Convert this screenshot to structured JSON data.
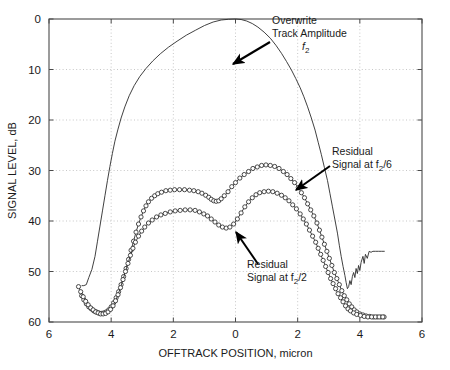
{
  "chart_data": {
    "type": "line",
    "title": "",
    "xlabel": "OFFTRACK POSITION, micron",
    "ylabel": "SIGNAL LEVEL, dB",
    "xlim": [
      -6,
      6
    ],
    "ylim": [
      60,
      0
    ],
    "y_inverted": true,
    "grid": true,
    "grid_style": "dotted",
    "legend_position": "none (inline annotations with arrows)",
    "xticks": [
      -6,
      -4,
      -2,
      0,
      2,
      4,
      6
    ],
    "xticklabels": [
      "6",
      "4",
      "2",
      "0",
      "2",
      "4",
      "6"
    ],
    "yticks": [
      0,
      10,
      20,
      30,
      40,
      50,
      60
    ],
    "yticklabels": [
      "0",
      "10",
      "20",
      "30",
      "40",
      "50",
      "60"
    ],
    "annotations": [
      {
        "name": "overwrite-track-amplitude",
        "line1": "Overwrite",
        "line2": "Track Amplitude",
        "line3_base": "f",
        "line3_sub": "2",
        "text_x": 272,
        "text_y": 24,
        "arrow_from": [
          270,
          42
        ],
        "arrow_to": [
          233,
          64
        ]
      },
      {
        "name": "residual-signal-f2-over-6",
        "line1": "Residual",
        "line2_base": "Signal at f",
        "line2_sub": "2",
        "line2_tail": "/6",
        "text_x": 332,
        "text_y": 155,
        "arrow_from": [
          330,
          166
        ],
        "arrow_to": [
          296,
          190
        ]
      },
      {
        "name": "residual-signal-f2-over-2",
        "line1": "Residual",
        "line2_base": "Signal at f",
        "line2_sub": "2",
        "line2_tail": "/2",
        "text_x": 247,
        "text_y": 268,
        "arrow_from": [
          258,
          264
        ],
        "arrow_to": [
          236,
          232
        ]
      }
    ],
    "series": [
      {
        "name": "Overwrite Track Amplitude f2",
        "style": "solid-thin-line",
        "marker": "none",
        "points": [
          [
            -4.95,
            52.8
          ],
          [
            -4.88,
            52.8
          ],
          [
            -4.8,
            52.6
          ],
          [
            -4.72,
            51.2
          ],
          [
            -4.62,
            49.6
          ],
          [
            -4.52,
            47.0
          ],
          [
            -4.44,
            44.0
          ],
          [
            -4.36,
            41.0
          ],
          [
            -4.28,
            38.0
          ],
          [
            -4.2,
            35.0
          ],
          [
            -4.12,
            32.0
          ],
          [
            -4.04,
            29.2
          ],
          [
            -3.96,
            26.6
          ],
          [
            -3.88,
            24.2
          ],
          [
            -3.78,
            21.8
          ],
          [
            -3.68,
            19.6
          ],
          [
            -3.56,
            17.4
          ],
          [
            -3.42,
            15.2
          ],
          [
            -3.26,
            13.2
          ],
          [
            -3.08,
            11.4
          ],
          [
            -2.88,
            9.8
          ],
          [
            -2.66,
            8.3
          ],
          [
            -2.42,
            6.9
          ],
          [
            -2.16,
            5.6
          ],
          [
            -1.88,
            4.4
          ],
          [
            -1.58,
            3.2
          ],
          [
            -1.28,
            2.2
          ],
          [
            -1.0,
            1.3
          ],
          [
            -0.72,
            0.6
          ],
          [
            -0.46,
            0.2
          ],
          [
            -0.22,
            0.05
          ],
          [
            0.0,
            0.0
          ],
          [
            0.18,
            0.1
          ],
          [
            0.36,
            0.4
          ],
          [
            0.54,
            0.9
          ],
          [
            0.72,
            1.6
          ],
          [
            0.92,
            2.6
          ],
          [
            1.12,
            3.8
          ],
          [
            1.3,
            5.2
          ],
          [
            1.48,
            6.8
          ],
          [
            1.64,
            8.4
          ],
          [
            1.8,
            10.1
          ],
          [
            1.94,
            11.8
          ],
          [
            2.08,
            13.6
          ],
          [
            2.2,
            15.4
          ],
          [
            2.32,
            17.4
          ],
          [
            2.44,
            19.6
          ],
          [
            2.56,
            22.0
          ],
          [
            2.66,
            24.4
          ],
          [
            2.76,
            26.8
          ],
          [
            2.86,
            29.4
          ],
          [
            2.96,
            32.0
          ],
          [
            3.04,
            34.6
          ],
          [
            3.12,
            37.2
          ],
          [
            3.2,
            39.8
          ],
          [
            3.28,
            42.4
          ],
          [
            3.34,
            44.8
          ],
          [
            3.4,
            47.0
          ],
          [
            3.46,
            49.0
          ],
          [
            3.52,
            50.8
          ],
          [
            3.56,
            52.2
          ],
          [
            3.6,
            53.4
          ],
          [
            3.64,
            53.0
          ],
          [
            3.68,
            51.8
          ],
          [
            3.72,
            52.6
          ],
          [
            3.76,
            51.0
          ],
          [
            3.8,
            50.2
          ],
          [
            3.84,
            51.2
          ],
          [
            3.88,
            49.4
          ],
          [
            3.92,
            50.4
          ],
          [
            3.96,
            48.8
          ],
          [
            4.0,
            49.8
          ],
          [
            4.04,
            48.2
          ],
          [
            4.1,
            47.0
          ],
          [
            4.14,
            48.4
          ],
          [
            4.18,
            46.6
          ],
          [
            4.24,
            47.4
          ],
          [
            4.3,
            46.0
          ],
          [
            4.36,
            46.2
          ],
          [
            4.42,
            46.0
          ],
          [
            4.5,
            46.0
          ],
          [
            4.6,
            46.0
          ],
          [
            4.7,
            46.0
          ],
          [
            4.8,
            46.0
          ]
        ]
      },
      {
        "name": "Residual Signal at f2/6",
        "style": "solid-thin-line-with-markers",
        "marker": "open-circle",
        "points": [
          [
            -4.95,
            54.8
          ],
          [
            -4.88,
            55.6
          ],
          [
            -4.8,
            56.4
          ],
          [
            -4.72,
            57.0
          ],
          [
            -4.64,
            57.4
          ],
          [
            -4.56,
            57.8
          ],
          [
            -4.48,
            58.0
          ],
          [
            -4.4,
            58.2
          ],
          [
            -4.32,
            58.3
          ],
          [
            -4.24,
            58.2
          ],
          [
            -4.16,
            58.0
          ],
          [
            -4.08,
            57.6
          ],
          [
            -4.0,
            57.0
          ],
          [
            -3.92,
            56.2
          ],
          [
            -3.84,
            55.2
          ],
          [
            -3.76,
            54.0
          ],
          [
            -3.68,
            52.6
          ],
          [
            -3.6,
            51.0
          ],
          [
            -3.52,
            49.4
          ],
          [
            -3.44,
            47.6
          ],
          [
            -3.36,
            45.8
          ],
          [
            -3.28,
            44.0
          ],
          [
            -3.2,
            42.2
          ],
          [
            -3.12,
            40.6
          ],
          [
            -3.04,
            39.2
          ],
          [
            -2.96,
            38.0
          ],
          [
            -2.88,
            37.0
          ],
          [
            -2.8,
            36.2
          ],
          [
            -2.7,
            35.5
          ],
          [
            -2.6,
            35.0
          ],
          [
            -2.5,
            34.6
          ],
          [
            -2.38,
            34.3
          ],
          [
            -2.24,
            34.0
          ],
          [
            -2.1,
            33.9
          ],
          [
            -1.96,
            33.8
          ],
          [
            -1.8,
            33.8
          ],
          [
            -1.64,
            33.8
          ],
          [
            -1.48,
            33.9
          ],
          [
            -1.34,
            34.0
          ],
          [
            -1.2,
            34.2
          ],
          [
            -1.08,
            34.5
          ],
          [
            -0.96,
            34.9
          ],
          [
            -0.86,
            35.3
          ],
          [
            -0.78,
            35.7
          ],
          [
            -0.7,
            36.0
          ],
          [
            -0.62,
            36.1
          ],
          [
            -0.54,
            36.0
          ],
          [
            -0.46,
            35.6
          ],
          [
            -0.36,
            35.0
          ],
          [
            -0.24,
            34.2
          ],
          [
            -0.12,
            33.2
          ],
          [
            0.0,
            32.4
          ],
          [
            0.14,
            31.5
          ],
          [
            0.28,
            30.8
          ],
          [
            0.42,
            30.2
          ],
          [
            0.56,
            29.6
          ],
          [
            0.7,
            29.3
          ],
          [
            0.84,
            29.0
          ],
          [
            0.98,
            28.9
          ],
          [
            1.12,
            29.0
          ],
          [
            1.26,
            29.2
          ],
          [
            1.4,
            29.6
          ],
          [
            1.54,
            30.2
          ],
          [
            1.66,
            30.8
          ],
          [
            1.78,
            31.6
          ],
          [
            1.9,
            32.4
          ],
          [
            2.02,
            33.4
          ],
          [
            2.12,
            34.4
          ],
          [
            2.22,
            35.4
          ],
          [
            2.32,
            36.6
          ],
          [
            2.42,
            37.8
          ],
          [
            2.52,
            39.0
          ],
          [
            2.62,
            40.4
          ],
          [
            2.7,
            41.8
          ],
          [
            2.78,
            43.2
          ],
          [
            2.86,
            44.6
          ],
          [
            2.94,
            46.0
          ],
          [
            3.02,
            47.4
          ],
          [
            3.1,
            48.8
          ],
          [
            3.18,
            50.2
          ],
          [
            3.26,
            51.4
          ],
          [
            3.34,
            52.6
          ],
          [
            3.42,
            53.8
          ],
          [
            3.5,
            54.8
          ],
          [
            3.58,
            55.6
          ],
          [
            3.66,
            56.4
          ],
          [
            3.74,
            57.0
          ],
          [
            3.82,
            57.6
          ],
          [
            3.9,
            58.0
          ],
          [
            4.0,
            58.4
          ],
          [
            4.1,
            58.6
          ],
          [
            4.2,
            58.8
          ],
          [
            4.32,
            58.9
          ],
          [
            4.44,
            59.0
          ],
          [
            4.56,
            59.0
          ],
          [
            4.68,
            59.0
          ],
          [
            4.78,
            59.0
          ]
        ]
      },
      {
        "name": "Residual Signal at f2/2",
        "style": "solid-thin-line-with-markers",
        "marker": "open-circle",
        "points": [
          [
            -5.05,
            53.0
          ],
          [
            -4.98,
            54.0
          ],
          [
            -4.9,
            55.0
          ],
          [
            -4.82,
            55.9
          ],
          [
            -4.74,
            56.6
          ],
          [
            -4.66,
            57.2
          ],
          [
            -4.58,
            57.6
          ],
          [
            -4.5,
            58.0
          ],
          [
            -4.42,
            58.2
          ],
          [
            -4.34,
            58.4
          ],
          [
            -4.26,
            58.4
          ],
          [
            -4.18,
            58.3
          ],
          [
            -4.1,
            58.0
          ],
          [
            -4.02,
            57.5
          ],
          [
            -3.94,
            56.8
          ],
          [
            -3.86,
            55.8
          ],
          [
            -3.78,
            54.6
          ],
          [
            -3.7,
            53.2
          ],
          [
            -3.62,
            51.6
          ],
          [
            -3.54,
            50.0
          ],
          [
            -3.46,
            48.4
          ],
          [
            -3.38,
            46.8
          ],
          [
            -3.3,
            45.4
          ],
          [
            -3.22,
            44.2
          ],
          [
            -3.12,
            43.0
          ],
          [
            -3.02,
            42.0
          ],
          [
            -2.92,
            41.2
          ],
          [
            -2.8,
            40.4
          ],
          [
            -2.68,
            39.8
          ],
          [
            -2.54,
            39.2
          ],
          [
            -2.4,
            38.8
          ],
          [
            -2.26,
            38.5
          ],
          [
            -2.1,
            38.2
          ],
          [
            -1.94,
            38.0
          ],
          [
            -1.78,
            37.9
          ],
          [
            -1.62,
            37.8
          ],
          [
            -1.46,
            37.8
          ],
          [
            -1.3,
            37.9
          ],
          [
            -1.16,
            38.2
          ],
          [
            -1.02,
            38.6
          ],
          [
            -0.9,
            39.0
          ],
          [
            -0.78,
            39.6
          ],
          [
            -0.66,
            40.2
          ],
          [
            -0.54,
            40.8
          ],
          [
            -0.42,
            41.2
          ],
          [
            -0.3,
            41.4
          ],
          [
            -0.18,
            41.2
          ],
          [
            -0.06,
            40.6
          ],
          [
            0.06,
            39.6
          ],
          [
            0.18,
            38.4
          ],
          [
            0.3,
            37.2
          ],
          [
            0.42,
            36.2
          ],
          [
            0.54,
            35.4
          ],
          [
            0.66,
            34.8
          ],
          [
            0.78,
            34.4
          ],
          [
            0.92,
            34.2
          ],
          [
            1.06,
            34.1
          ],
          [
            1.2,
            34.2
          ],
          [
            1.34,
            34.5
          ],
          [
            1.48,
            34.9
          ],
          [
            1.6,
            35.4
          ],
          [
            1.72,
            36.0
          ],
          [
            1.84,
            36.8
          ],
          [
            1.96,
            37.6
          ],
          [
            2.08,
            38.6
          ],
          [
            2.18,
            39.6
          ],
          [
            2.28,
            40.6
          ],
          [
            2.38,
            41.8
          ],
          [
            2.48,
            43.0
          ],
          [
            2.58,
            44.2
          ],
          [
            2.66,
            45.4
          ],
          [
            2.74,
            46.6
          ],
          [
            2.82,
            47.8
          ],
          [
            2.9,
            49.0
          ],
          [
            2.98,
            50.2
          ],
          [
            3.06,
            51.4
          ],
          [
            3.14,
            52.4
          ],
          [
            3.22,
            53.4
          ],
          [
            3.3,
            54.4
          ],
          [
            3.38,
            55.2
          ],
          [
            3.46,
            56.0
          ],
          [
            3.54,
            56.8
          ],
          [
            3.62,
            57.4
          ],
          [
            3.7,
            57.8
          ],
          [
            3.8,
            58.2
          ],
          [
            3.9,
            58.5
          ],
          [
            4.02,
            58.7
          ],
          [
            4.14,
            58.9
          ],
          [
            4.26,
            59.0
          ],
          [
            4.38,
            59.0
          ],
          [
            4.5,
            59.0
          ],
          [
            4.62,
            59.0
          ],
          [
            4.74,
            59.0
          ]
        ]
      }
    ]
  }
}
